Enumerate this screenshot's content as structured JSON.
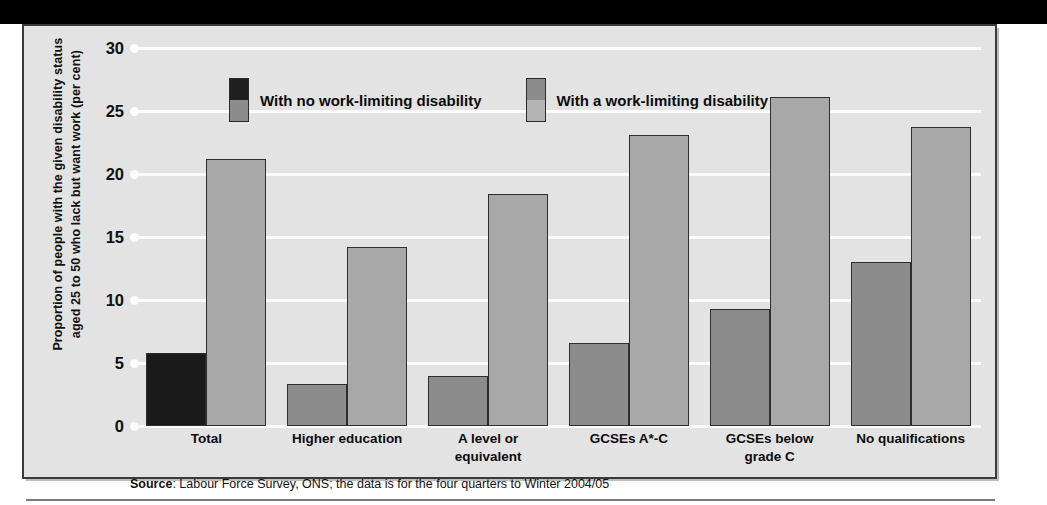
{
  "topband": {
    "cropped_title": ""
  },
  "chart_data": {
    "type": "bar",
    "title": "",
    "xlabel": "",
    "ylabel": "Proportion of people with the given disability status aged 25 to 50 who lack but want work (per cent)",
    "ylim": [
      0,
      30
    ],
    "yticks": [
      "0",
      "5",
      "10",
      "15",
      "20",
      "25",
      "30"
    ],
    "grid": true,
    "legend_position": "top-center",
    "categories": [
      "Total",
      "Higher education",
      "A level or equivalent",
      "GCSEs A*-C",
      "GCSEs below grade C",
      "No qualifications"
    ],
    "series": [
      {
        "name": "With no work-limiting disability",
        "color": "#8c8c8c",
        "values": [
          5.8,
          3.3,
          4.0,
          6.6,
          9.3,
          13.0
        ]
      },
      {
        "name": "With a work-limiting disability",
        "color": "#a8a8a8",
        "values": [
          21.2,
          14.2,
          18.4,
          23.1,
          26.1,
          23.7
        ]
      }
    ],
    "first_group_series1_color": "#1a1a1a",
    "source": {
      "label": "Source",
      "text": ": Labour Force Survey, ONS; the data is for the four quarters to Winter 2004/05"
    }
  },
  "categories_display": [
    {
      "line1": "Total",
      "line2": ""
    },
    {
      "line1": "Higher education",
      "line2": ""
    },
    {
      "line1": "A level or",
      "line2": "equivalent"
    },
    {
      "line1": "GCSEs A*-C",
      "line2": ""
    },
    {
      "line1": "GCSEs below",
      "line2": "grade C"
    },
    {
      "line1": "No qualifications",
      "line2": ""
    }
  ],
  "yticks": [
    {
      "label": "30"
    },
    {
      "label": "25"
    },
    {
      "label": "20"
    },
    {
      "label": "15"
    },
    {
      "label": "10"
    },
    {
      "label": "5"
    },
    {
      "label": "0"
    }
  ],
  "legend": [
    {
      "label": "With no work-limiting disability",
      "top": "#1f1f1f",
      "bottom": "#8c8c8c"
    },
    {
      "label": "With a work-limiting disability",
      "top": "#8c8c8c",
      "bottom": "#b4b4b4"
    }
  ],
  "colors": {
    "panel_bg": "#e3e3e3",
    "grid": "#fbfbfb",
    "bar_dark": "#1a1a1a",
    "bar_mid": "#8c8c8c",
    "bar_light": "#a8a8a8",
    "border": "#2e2e2e",
    "band": "#000000"
  }
}
